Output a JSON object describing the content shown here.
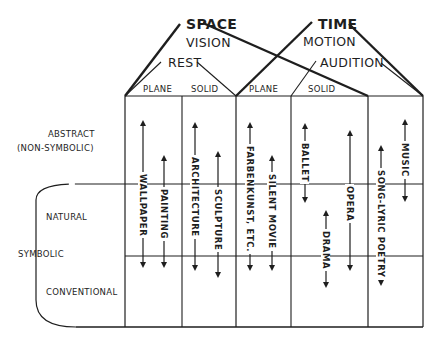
{
  "top_groups": {
    "space": {
      "title": "SPACE",
      "sense": "VISION",
      "state": "REST"
    },
    "time": {
      "title": "TIME",
      "sense": "MOTION",
      "state": "AUDITION"
    }
  },
  "column_headers": [
    "PLANE",
    "SOLID",
    "PLANE",
    "SOLID"
  ],
  "row_labels": {
    "abstract": "ABSTRACT",
    "abstract_sub": "(NON-SYMBOLIC)",
    "natural": "NATURAL",
    "symbolic": "SYMBOLIC",
    "conventional": "CONVENTIONAL"
  },
  "art_forms": [
    {
      "label": "WALLPAPER"
    },
    {
      "label": "PAINTING"
    },
    {
      "label": "ARCHITECTURE"
    },
    {
      "label": "SCULPTURE"
    },
    {
      "label": "FARBENKUNST, ETC."
    },
    {
      "label": "SILENT MOVIE"
    },
    {
      "label": "BALLET"
    },
    {
      "label": "DRAMA"
    },
    {
      "label": "OPERA"
    },
    {
      "label": "SONG-LYRIC POETRY"
    },
    {
      "label": "MUSIC"
    }
  ],
  "colors": {
    "ink": "#1e1e1e",
    "background": "#ffffff"
  }
}
